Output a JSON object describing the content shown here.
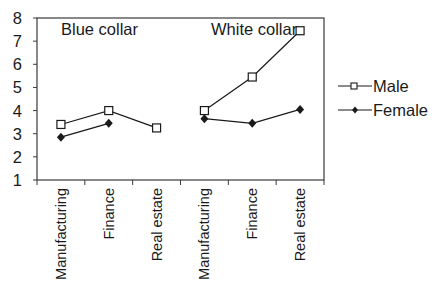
{
  "chart_data": {
    "type": "line",
    "title": "",
    "xlabel": "",
    "ylabel": "",
    "ylim": [
      1,
      8
    ],
    "yticks": [
      1,
      2,
      3,
      4,
      5,
      6,
      7,
      8
    ],
    "grid": false,
    "legend_position": "right",
    "groups": [
      {
        "name": "Blue collar",
        "categories": [
          "Manufacturing",
          "Finance",
          "Real estate"
        ]
      },
      {
        "name": "White collar",
        "categories": [
          "Manufacturing",
          "Finance",
          "Real estate"
        ]
      }
    ],
    "categories": [
      "Manufacturing",
      "Finance",
      "Real estate",
      "Manufacturing",
      "Finance",
      "Real estate"
    ],
    "series": [
      {
        "name": "Male",
        "marker": "open-square",
        "values": [
          3.4,
          4.0,
          3.25,
          4.0,
          5.45,
          7.45
        ]
      },
      {
        "name": "Female",
        "marker": "filled-diamond",
        "values": [
          2.85,
          3.45,
          null,
          3.65,
          3.45,
          4.05
        ]
      }
    ]
  },
  "legend": {
    "items": [
      {
        "label": "Male"
      },
      {
        "label": "Female"
      }
    ]
  },
  "annotations": {
    "blue_collar": "Blue collar",
    "white_collar": "White collar"
  },
  "colors": {
    "line": "#1a1a1a",
    "frame": "#3a3a3a",
    "background": "#ffffff"
  }
}
